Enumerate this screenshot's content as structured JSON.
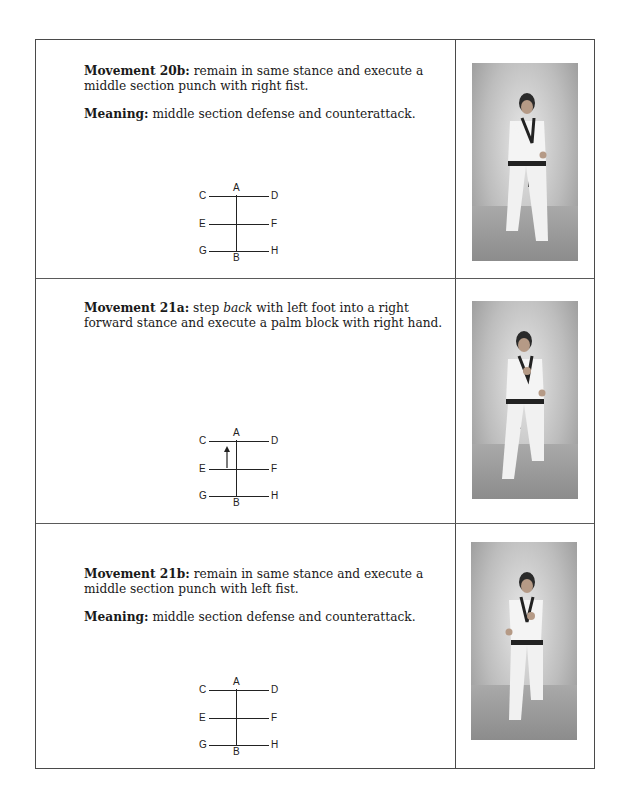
{
  "movements": [
    {
      "id": "20b",
      "label": "Movement 20b:",
      "description": "remain in same stance and execute a middle section punch with right fist.",
      "meaning_label": "Meaning:",
      "meaning": "middle section defense and counterattack.",
      "diagram": {
        "labels": [
          "A",
          "B",
          "C",
          "D",
          "E",
          "F",
          "G",
          "H"
        ],
        "arrow": false
      },
      "photo_alt": "Practitioner in forward stance executing middle section punch with right fist"
    },
    {
      "id": "21a",
      "label": "Movement 21a:",
      "description_pre": "step ",
      "description_em": "back",
      "description_post": " with left foot into a right forward stance and execute a palm block with right hand.",
      "diagram": {
        "labels": [
          "A",
          "B",
          "C",
          "D",
          "E",
          "F",
          "G",
          "H"
        ],
        "arrow": true,
        "arrow_direction": "up"
      },
      "photo_alt": "Practitioner in right forward stance executing palm block with right hand"
    },
    {
      "id": "21b",
      "label": "Movement 21b:",
      "description": "remain in same stance and execute a middle section punch with left fist.",
      "meaning_label": "Meaning:",
      "meaning": "middle section defense and counterattack.",
      "diagram": {
        "labels": [
          "A",
          "B",
          "C",
          "D",
          "E",
          "F",
          "G",
          "H"
        ],
        "arrow": false
      },
      "photo_alt": "Practitioner in forward stance executing middle section punch with left fist"
    }
  ],
  "colors": {
    "border": "#4a4a4a",
    "text": "#1a1a1a",
    "photo_bg": "#bdbdbd"
  }
}
